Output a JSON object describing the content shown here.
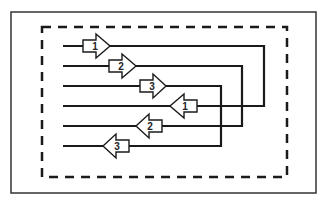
{
  "diagram": {
    "type": "signal-flow-loops",
    "colors": {
      "line": "#1a1a1a",
      "arrow_fill": "#ffffff",
      "background": "#ffffff"
    },
    "outer_frame": {
      "x": 11,
      "y": 12,
      "width": 305,
      "height": 181,
      "style": "solid"
    },
    "inner_frame": {
      "x": 42,
      "y": 27,
      "width": 245,
      "height": 150,
      "style": "dashed"
    },
    "loops": [
      {
        "id": 1,
        "top_y": 46,
        "bottom_y": 106,
        "right_x": 264
      },
      {
        "id": 2,
        "top_y": 66,
        "bottom_y": 126,
        "right_x": 242
      },
      {
        "id": 3,
        "top_y": 86,
        "bottom_y": 146,
        "right_x": 221
      }
    ],
    "line_start_x": 63,
    "arrows": [
      {
        "label": "1",
        "direction": "right",
        "y": 46,
        "rect_x": 83,
        "tip_x": 110
      },
      {
        "label": "2",
        "direction": "right",
        "y": 66,
        "rect_x": 109,
        "tip_x": 136
      },
      {
        "label": "3",
        "direction": "right",
        "y": 86,
        "rect_x": 140,
        "tip_x": 166
      },
      {
        "label": "1",
        "direction": "left",
        "y": 106,
        "rect_x": 197,
        "tip_x": 170
      },
      {
        "label": "2",
        "direction": "left",
        "y": 126,
        "rect_x": 162,
        "tip_x": 136
      },
      {
        "label": "3",
        "direction": "left",
        "y": 146,
        "rect_x": 129,
        "tip_x": 103
      }
    ]
  }
}
